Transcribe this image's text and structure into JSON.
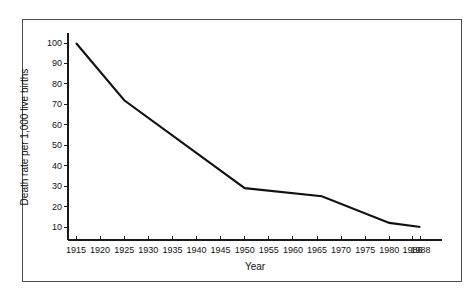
{
  "chart_data": {
    "type": "line",
    "title": "",
    "subtitle": "",
    "xlabel": "Year",
    "ylabel": "Death rate per 1,000 live births",
    "xlim": [
      1915,
      1988
    ],
    "ylim": [
      0,
      105
    ],
    "grid": false,
    "legend": null,
    "legend_position": "none",
    "line_color": "#111111",
    "x_tick_labels": [
      "1915",
      "1920",
      "1925",
      "1930",
      "1935",
      "1940",
      "1945",
      "1950",
      "1955",
      "1960",
      "1965",
      "1970",
      "1975",
      "1980",
      "1986",
      "1988"
    ],
    "x_tick_values": [
      1915,
      1920,
      1925,
      1930,
      1935,
      1940,
      1945,
      1950,
      1955,
      1960,
      1965,
      1970,
      1975,
      1980,
      1986,
      1988
    ],
    "y_tick_labels": [
      "10",
      "20",
      "30",
      "40",
      "50",
      "60",
      "70",
      "80",
      "90",
      "100"
    ],
    "y_tick_values": [
      10,
      20,
      30,
      40,
      50,
      60,
      70,
      80,
      90,
      100
    ],
    "series": [
      {
        "name": "Infant death rate",
        "x": [
          1915,
          1925,
          1950,
          1966,
          1980,
          1988
        ],
        "values": [
          100,
          72,
          29,
          25,
          12,
          10
        ]
      }
    ]
  }
}
